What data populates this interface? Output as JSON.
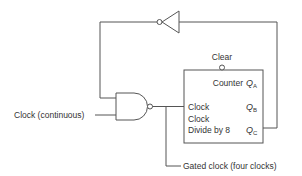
{
  "diagram": {
    "type": "logic-circuit",
    "colors": {
      "line": "#555555",
      "text": "#333333",
      "background": "#ffffff"
    },
    "labels": {
      "clock_input": "Clock (continuous)",
      "gated_output": "Gated clock (four clocks)",
      "clear": "Clear",
      "counter": "Counter",
      "clock_pin": "Clock",
      "clock2": "Clock",
      "divide": "Divide by 8",
      "qa": "Q",
      "qa_sub": "A",
      "qb": "Q",
      "qb_sub": "B",
      "qc": "Q",
      "qc_sub": "C"
    },
    "components": [
      {
        "id": "nand-gate",
        "kind": "NAND"
      },
      {
        "id": "inverter",
        "kind": "NOT"
      },
      {
        "id": "counter",
        "kind": "Divide-by-8 counter"
      }
    ]
  }
}
